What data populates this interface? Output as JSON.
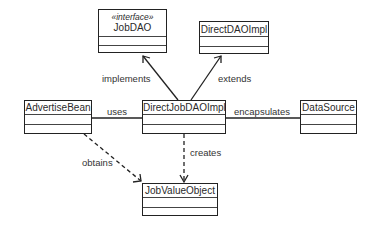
{
  "diagram": {
    "type": "UML class diagram",
    "classes": [
      {
        "id": "jobdao",
        "name": "JobDAO",
        "stereotype": "«interface»"
      },
      {
        "id": "directdaoimpl",
        "name": "DirectDAOImpl"
      },
      {
        "id": "advertisebean",
        "name": "AdvertiseBean"
      },
      {
        "id": "directjobdaoimpl",
        "name": "DirectJobDAOImpl"
      },
      {
        "id": "datasource",
        "name": "DataSource"
      },
      {
        "id": "jobvalueobject",
        "name": "JobValueObject"
      }
    ],
    "relations": [
      {
        "from": "DirectJobDAOImpl",
        "to": "JobDAO",
        "label": "implements",
        "style": "solid-open-arrow"
      },
      {
        "from": "DirectJobDAOImpl",
        "to": "DirectDAOImpl",
        "label": "extends",
        "style": "solid-open-arrow"
      },
      {
        "from": "AdvertiseBean",
        "to": "DirectJobDAOImpl",
        "label": "uses",
        "style": "association"
      },
      {
        "from": "DirectJobDAOImpl",
        "to": "DataSource",
        "label": "encapsulates",
        "style": "association"
      },
      {
        "from": "AdvertiseBean",
        "to": "JobValueObject",
        "label": "obtains",
        "style": "dashed-open-arrow"
      },
      {
        "from": "DirectJobDAOImpl",
        "to": "JobValueObject",
        "label": "creates",
        "style": "dashed-open-arrow"
      }
    ]
  }
}
